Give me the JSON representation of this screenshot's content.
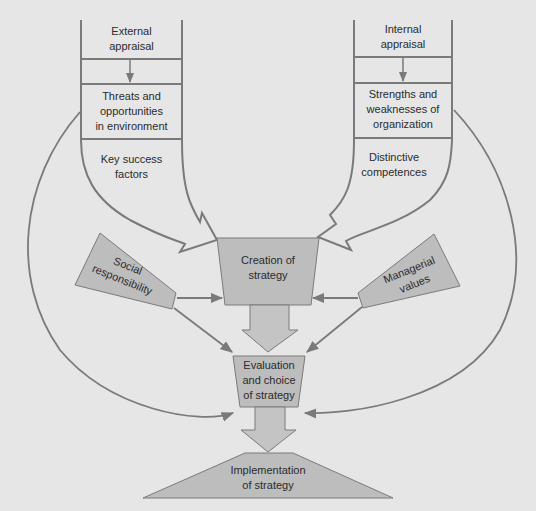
{
  "diagram": {
    "type": "strategy-formulation-flow",
    "colors": {
      "background": "#e6e6e6",
      "line": "#7a7a7a",
      "box_fill": "#bdbdbd",
      "arrow_fill": "#c4c4c4",
      "text": "#2b2b2b"
    },
    "external": {
      "title": [
        "External",
        "appraisal"
      ],
      "middle": [
        "Threats and",
        "opportunities",
        "in environment"
      ],
      "bottom": [
        "Key success",
        "factors"
      ]
    },
    "internal": {
      "title": [
        "Internal",
        "appraisal"
      ],
      "middle": [
        "Strengths and",
        "weaknesses of",
        "organization"
      ],
      "bottom": [
        "Distinctive",
        "competences"
      ]
    },
    "social": [
      "Social",
      "responsibility"
    ],
    "managerial": [
      "Managerial",
      "values"
    ],
    "creation": [
      "Creation of",
      "strategy"
    ],
    "evaluation": [
      "Evaluation",
      "and choice",
      "of strategy"
    ],
    "implementation": [
      "Implementation",
      "of strategy"
    ]
  }
}
